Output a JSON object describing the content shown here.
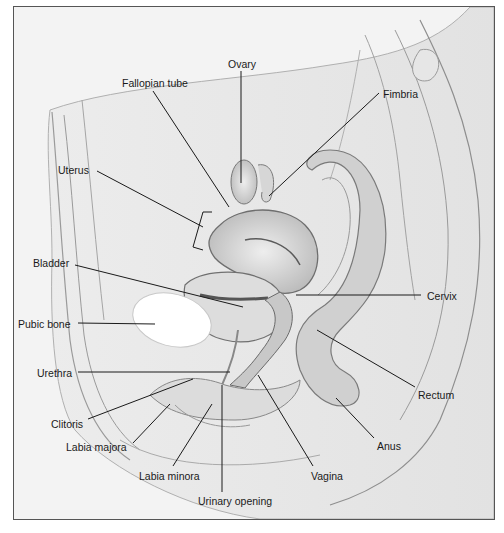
{
  "figure": {
    "type": "anatomical-illustration",
    "colors": {
      "background": "#f3f3f3",
      "frame": "#555555",
      "leader": "#1a1a1a",
      "tissue": "#dcdcdc",
      "shadow": "#8c8c8c",
      "bone": "#ffffff"
    }
  },
  "labels": [
    {
      "id": "ovary",
      "text": "Ovary",
      "x": 228,
      "y": 58,
      "line": [
        241,
        71,
        241,
        183
      ]
    },
    {
      "id": "fallopian-tube",
      "text": "Fallopian tube",
      "x": 122,
      "y": 77,
      "line": [
        153,
        91,
        229,
        207
      ]
    },
    {
      "id": "fimbria",
      "text": "Fimbria",
      "x": 383,
      "y": 88,
      "line": [
        379,
        93,
        269,
        196
      ]
    },
    {
      "id": "uterus",
      "text": "Uterus",
      "x": 58,
      "y": 164,
      "line": [
        97,
        171,
        203,
        227
      ]
    },
    {
      "id": "bladder",
      "text": "Bladder",
      "x": 33,
      "y": 257,
      "line": [
        75,
        265,
        243,
        307
      ]
    },
    {
      "id": "cervix",
      "text": "Cervix",
      "x": 427,
      "y": 290,
      "line": [
        296,
        295,
        421,
        295
      ]
    },
    {
      "id": "pubic-bone",
      "text": "Pubic bone",
      "x": 18,
      "y": 318,
      "line": [
        78,
        323,
        155,
        324
      ]
    },
    {
      "id": "urethra",
      "text": "Urethra",
      "x": 37,
      "y": 367,
      "line": [
        78,
        372,
        230,
        372
      ]
    },
    {
      "id": "rectum",
      "text": "Rectum",
      "x": 418,
      "y": 389,
      "line": [
        415,
        387,
        317,
        330
      ]
    },
    {
      "id": "clitoris",
      "text": "Clitoris",
      "x": 51,
      "y": 418,
      "line": [
        88,
        419,
        193,
        379
      ]
    },
    {
      "id": "labia-majora",
      "text": "Labia majora",
      "x": 66,
      "y": 441,
      "line": [
        133,
        443,
        170,
        404
      ]
    },
    {
      "id": "anus",
      "text": "Anus",
      "x": 377,
      "y": 440,
      "line": [
        374,
        438,
        336,
        398
      ]
    },
    {
      "id": "labia-minora",
      "text": "Labia minora",
      "x": 139,
      "y": 470,
      "line": [
        173,
        466,
        212,
        404
      ]
    },
    {
      "id": "vagina",
      "text": "Vagina",
      "x": 311,
      "y": 470,
      "line": [
        313,
        466,
        258,
        375
      ]
    },
    {
      "id": "urinary-opening",
      "text": "Urinary opening",
      "x": 198,
      "y": 495,
      "line": [
        222,
        492,
        222,
        385
      ]
    }
  ]
}
